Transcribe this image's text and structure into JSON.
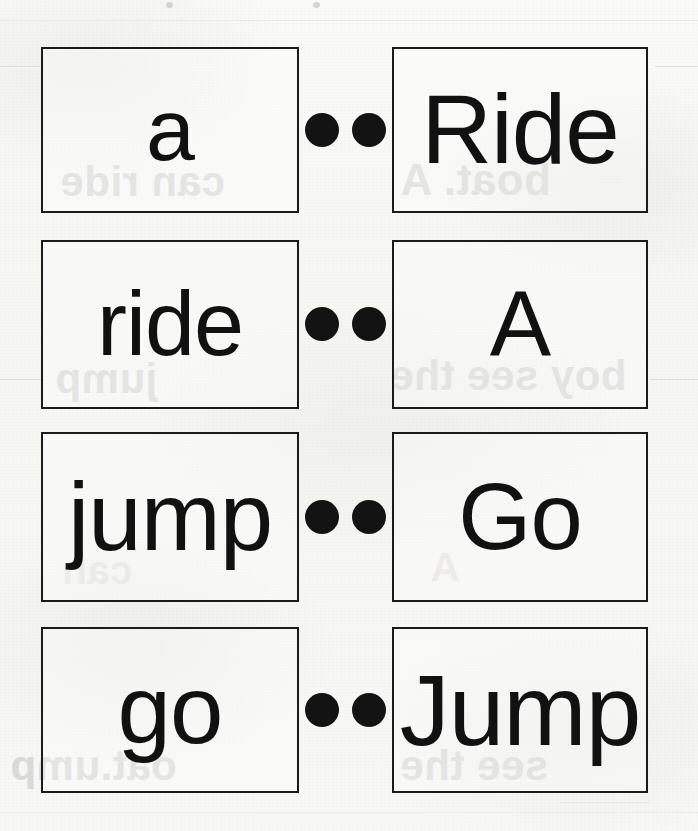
{
  "worksheet": {
    "title": "Word Matching Cards",
    "rows": [
      {
        "left_word": "a",
        "right_word": "Ride",
        "dot_left": "match-dot",
        "dot_right": "match-dot"
      },
      {
        "left_word": "ride",
        "right_word": "A",
        "dot_left": "match-dot",
        "dot_right": "match-dot"
      },
      {
        "left_word": "jump",
        "right_word": "Go",
        "dot_left": "match-dot",
        "dot_right": "match-dot"
      },
      {
        "left_word": "go",
        "right_word": "Jump",
        "dot_left": "match-dot",
        "dot_right": "match-dot"
      }
    ]
  },
  "bleed_through": {
    "row1_left": "can ride",
    "row1_right": "boat. A",
    "row2_left": "jump",
    "row2_right": "boy see the",
    "row3_left": "can",
    "row3_right": "A",
    "row4_left": "oat.ump",
    "row4_right": "see the"
  },
  "colors": {
    "ink": "#111111",
    "card_border": "#1b1b1b",
    "paper": "#f8f8f6",
    "bleed_text": "#cfcfca"
  }
}
